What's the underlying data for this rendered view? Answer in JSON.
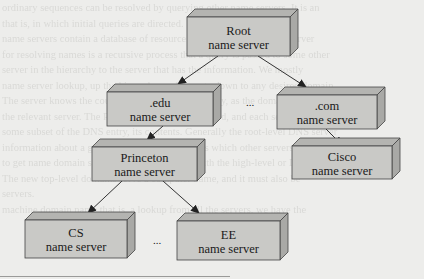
{
  "diagram": {
    "colors": {
      "background": "#ededeb",
      "box_front": "#c9c9c6",
      "box_top": "#b4b4b1",
      "box_side": "#a9a9a6",
      "edge": "#333333",
      "text": "#1a1a1a"
    },
    "nodes": [
      {
        "id": "root",
        "line1": "Root",
        "line2": "name server",
        "x": 187,
        "y": 17,
        "w": 103,
        "h": 39
      },
      {
        "id": "edu",
        "line1": ".edu",
        "line2": "name server",
        "x": 107,
        "y": 92,
        "w": 106,
        "h": 34
      },
      {
        "id": "com",
        "line1": ".com",
        "line2": "name server",
        "x": 277,
        "y": 95,
        "w": 100,
        "h": 34
      },
      {
        "id": "princeton",
        "line1": "Princeton",
        "line2": "name server",
        "x": 92,
        "y": 147,
        "w": 105,
        "h": 34
      },
      {
        "id": "cisco",
        "line1": "Cisco",
        "line2": "name server",
        "x": 292,
        "y": 146,
        "w": 100,
        "h": 33
      },
      {
        "id": "cs",
        "line1": "CS",
        "line2": "name server",
        "x": 25,
        "y": 220,
        "w": 102,
        "h": 38
      },
      {
        "id": "ee",
        "line1": "EE",
        "line2": "name server",
        "x": 177,
        "y": 221,
        "w": 103,
        "h": 39
      }
    ],
    "edges": [
      {
        "from": "root",
        "to": "edu",
        "x1": 218,
        "y1": 56,
        "x2": 178,
        "y2": 84
      },
      {
        "from": "root",
        "to": "com",
        "x1": 258,
        "y1": 56,
        "x2": 306,
        "y2": 87
      },
      {
        "from": "edu",
        "to": "princeton",
        "x1": 163,
        "y1": 126,
        "x2": 147,
        "y2": 140
      },
      {
        "from": "com",
        "to": "cisco",
        "x1": 326,
        "y1": 129,
        "x2": 342,
        "y2": 145
      },
      {
        "from": "princeton",
        "to": "cs",
        "x1": 122,
        "y1": 181,
        "x2": 88,
        "y2": 213
      },
      {
        "from": "princeton",
        "to": "ee",
        "x1": 163,
        "y1": 181,
        "x2": 199,
        "y2": 213
      }
    ],
    "ellipses": [
      {
        "id": "ellipsis-tld",
        "text": "...",
        "x": 250,
        "y": 106
      },
      {
        "id": "ellipsis-dept",
        "text": "...",
        "x": 157,
        "y": 244
      }
    ]
  },
  "background_text": [
    "ordinary sequences can be resolved by querying other name servers. It is an",
    "that is, in which initial queries are directed.",
    "     name servers contain a database of resource records. The root name server",
    "for resolving names is a recursive process that a query is passed to some other",
    "server in the hierarchy to the server that has the information. We mostly",
    "name server lookup, up the hierarchy, and then go down to any desired domain.",
    "     The server knows the country domain, pass the query, as the domain suffix",
    "the relevant server. The Princeton domain is searched, and each server in the",
    "some subset of the DNS entry, its contents. Generally the root-level DNS server",
    "information about a given zone and name servers which other servers are able",
    "to get name domain servers by their positions with the high-level or DNS zone",
    "     The new top-level domains serve a computer name, and it must also be",
    "",
    "     servers.",
    "machine domain name that is, a lookup from all the servers, we have the"
  ]
}
